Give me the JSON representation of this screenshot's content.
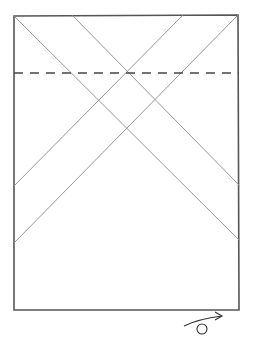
{
  "diagram": {
    "type": "origami-crease-diagram",
    "width": 256,
    "height": 338,
    "colors": {
      "background": "#ffffff",
      "paper_edge": "#555555",
      "crease": "#8a8a8a",
      "valley_fold": "#444444",
      "symbol": "#333333"
    },
    "paper": {
      "shape": "rectangle",
      "corners": [
        [
          14,
          16
        ],
        [
          238,
          15
        ],
        [
          239,
          310
        ],
        [
          14,
          310
        ]
      ]
    },
    "creases": [
      {
        "id": "crease-1",
        "from": [
          14,
          16
        ],
        "to": [
          239,
          240
        ]
      },
      {
        "id": "crease-2",
        "from": [
          72,
          15
        ],
        "to": [
          239,
          185
        ]
      },
      {
        "id": "crease-3",
        "from": [
          183,
          15
        ],
        "to": [
          14,
          186
        ]
      },
      {
        "id": "crease-4",
        "from": [
          238,
          15
        ],
        "to": [
          14,
          243
        ]
      }
    ],
    "fold_lines": [
      {
        "id": "valley-fold-horizontal",
        "style": "dashed",
        "from": [
          14,
          73
        ],
        "to": [
          239,
          73
        ]
      }
    ],
    "symbols": [
      {
        "id": "turn-over",
        "meaning": "turn model over",
        "position": [
          202,
          325
        ]
      }
    ]
  }
}
